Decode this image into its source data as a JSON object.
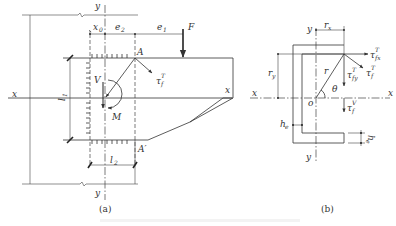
{
  "figure": {
    "panel_a": {
      "caption": "(a)",
      "labels": {
        "axis_x_left": "x",
        "axis_x_right": "x",
        "axis_y_top": "y",
        "axis_y_bottom": "y",
        "x0": "x",
        "x0_sub": "0",
        "e2": "e",
        "e2_sub": "2",
        "e1": "e",
        "e1_sub": "1",
        "force": "F",
        "point_a": "A",
        "point_a_prime": "A′",
        "shear_v": "V",
        "moment": "M",
        "tau": "τ",
        "tau_sub": "f",
        "tau_sup": "T",
        "l1": "l",
        "l1_sub": "1",
        "l2": "l",
        "l2_sub": "2"
      }
    },
    "panel_b": {
      "caption": "(b)",
      "labels": {
        "axis_x_left": "x",
        "axis_x_right": "x",
        "axis_y_top": "y",
        "axis_y_bottom": "y",
        "origin": "o",
        "rx": "r",
        "rx_sub": "x",
        "ry": "r",
        "ry_sub": "y",
        "r": "r",
        "theta": "θ",
        "tau": "τ",
        "tau_fx_sub": "fx",
        "tau_fy_sub": "fy",
        "tau_f_sub": "f",
        "sup_T": "T",
        "sup_V": "V",
        "he_left": "h",
        "he_left_sub": "e",
        "he_right": "h",
        "he_right_sub": "e"
      }
    },
    "footer_caption": "                                                        "
  }
}
